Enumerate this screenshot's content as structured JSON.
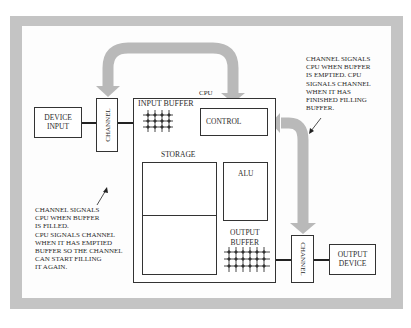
{
  "diagram": {
    "type": "data-flow",
    "nodes": {
      "device_input": "DEVICE\nINPUT",
      "channel_in": "CHANNEL",
      "cpu": "CPU",
      "input_buffer": "INPUT BUFFER",
      "control": "CONTROL",
      "storage": "STORAGE",
      "alu": "ALU",
      "output_buffer": "OUTPUT\nBUFFER",
      "channel_out": "CHANNEL",
      "output_device": "OUTPUT\nDEVICE"
    },
    "notes": {
      "left": "CHANNEL SIGNALS\nCPU WHEN BUFFER\nIS FILLED.\nCPU SIGNALS CHANNEL\nWHEN IT HAS EMPTIED\nBUFFER SO THE CHANNEL\nCAN START FILLING\nIT AGAIN.",
      "right": "CHANNEL SIGNALS\nCPU WHEN BUFFER\nIS EMPTIED. CPU\nSIGNALS CHANNEL\nWHEN IT HAS\nFINISHED FILLING\nBUFFER."
    },
    "edges": [
      {
        "from": "device_input",
        "to": "channel_in",
        "style": "thick-line"
      },
      {
        "from": "channel_in",
        "to": "cpu",
        "style": "thick-line"
      },
      {
        "from": "control",
        "to": "channel_in",
        "style": "wide-gray-arrow"
      },
      {
        "from": "control",
        "to": "channel_out",
        "style": "wide-gray-arrow"
      },
      {
        "from": "cpu",
        "to": "channel_out",
        "style": "thick-line"
      },
      {
        "from": "channel_out",
        "to": "output_device",
        "style": "thick-line"
      }
    ],
    "colors": {
      "frame": "#c4c4c4",
      "arrow": "#b8b8b8",
      "line": "#333333",
      "background": "#fdfdfd"
    }
  }
}
